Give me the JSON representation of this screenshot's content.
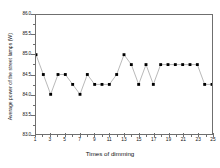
{
  "chart_data": {
    "type": "line",
    "title": "",
    "xlabel": "Times of dimming",
    "ylabel": "Average power of the street lamps (W)",
    "xlim": [
      1,
      25
    ],
    "ylim": [
      83.0,
      86.0
    ],
    "grid": false,
    "legend": null,
    "marker": "filled-square",
    "line_color": "#999999",
    "marker_color": "#000000",
    "x": [
      1,
      2,
      3,
      4,
      5,
      6,
      7,
      8,
      9,
      10,
      11,
      12,
      13,
      14,
      15,
      16,
      17,
      18,
      19,
      20,
      21,
      22,
      23,
      24,
      25
    ],
    "values": [
      85.0,
      84.5,
      84.0,
      84.5,
      84.5,
      84.25,
      84.0,
      84.5,
      84.25,
      84.25,
      84.25,
      84.5,
      85.0,
      84.75,
      84.25,
      84.75,
      84.25,
      84.75,
      84.75,
      84.75,
      84.75,
      84.75,
      84.75,
      84.25,
      84.25
    ],
    "y_ticks": [
      86.0,
      85.5,
      85.0,
      84.5,
      84.0,
      83.5,
      83.0
    ],
    "y_tick_labels": [
      "86.0",
      "85.5",
      "85.0",
      "84.5",
      "84.0",
      "83.5",
      "83.0"
    ],
    "x_ticks": [
      1,
      3,
      5,
      7,
      9,
      11,
      13,
      15,
      17,
      19,
      21,
      23,
      25
    ],
    "x_tick_labels": [
      "1",
      "3",
      "5",
      "7",
      "9",
      "11",
      "13",
      "15",
      "17",
      "19",
      "21",
      "23",
      "25"
    ],
    "x_minor_ticks": [
      2,
      4,
      6,
      8,
      10,
      12,
      14,
      16,
      18,
      20,
      22,
      24
    ],
    "y_minor_ticks": [
      85.75,
      85.25,
      84.75,
      84.25,
      83.75,
      83.25
    ]
  }
}
